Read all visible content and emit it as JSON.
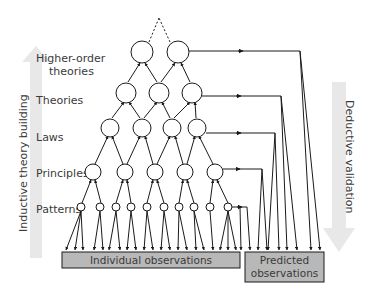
{
  "levels": {
    "higher_order_line1": "Higher-order",
    "higher_order_line2": "theories",
    "theories": "Theories",
    "laws": "Laws",
    "principles": "Principles",
    "patterns": "Patterns"
  },
  "side_arrows": {
    "left": "Inductive theory building",
    "right": "Deductive validation"
  },
  "boxes": {
    "individual": "Individual observations",
    "predicted_line1": "Predicted",
    "predicted_line2": "observations"
  },
  "colors": {
    "box_fill": "#b8b8b8",
    "side_arrow": "#e6e6e6",
    "line": "#1a1a1a",
    "text": "#3a3a3a"
  }
}
